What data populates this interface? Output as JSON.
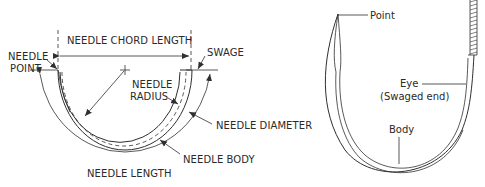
{
  "left_diagram": {
    "title": "Needle anatomy (dimensions)",
    "labels": {
      "chord_length": "NEEDLE CHORD LENGTH",
      "point_line1": "NEEDLE",
      "point_line2": "POINT",
      "swage": "SWAGE",
      "radius_line1": "NEEDLE",
      "radius_line2": "RADIUS",
      "diameter": "NEEDLE DIAMETER",
      "body": "NEEDLE BODY",
      "length": "NEEDLE LENGTH"
    }
  },
  "right_diagram": {
    "title": "Swaged needle with suture",
    "labels": {
      "point": "Point",
      "eye_line1": "Eye",
      "eye_line2": "(Swaged end)",
      "body": "Body"
    }
  },
  "colors": {
    "line": "#2f2f2f",
    "text": "#2a2a2a",
    "background": "#ffffff"
  }
}
